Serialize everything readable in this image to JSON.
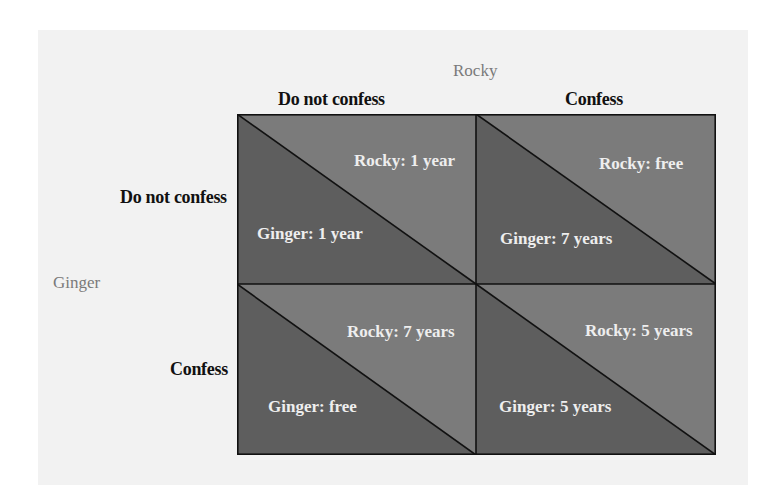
{
  "players": {
    "column": "Rocky",
    "row": "Ginger"
  },
  "column_strategies": [
    "Do not confess",
    "Confess"
  ],
  "row_strategies": [
    "Do not confess",
    "Confess"
  ],
  "colors": {
    "panel_background": "#f2f2f2",
    "upper_triangle": "#7b7b7b",
    "lower_triangle": "#5e5e5e",
    "grid_lines": "#111111",
    "cell_text": "#eeeeee",
    "player_label": "#7a7a7a"
  },
  "cells": [
    {
      "row": "Do not confess",
      "col": "Do not confess",
      "rocky": "Rocky: 1 year",
      "ginger": "Ginger: 1 year"
    },
    {
      "row": "Do not confess",
      "col": "Confess",
      "rocky": "Rocky: free",
      "ginger": "Ginger: 7 years"
    },
    {
      "row": "Confess",
      "col": "Do not confess",
      "rocky": "Rocky: 7 years",
      "ginger": "Ginger: free"
    },
    {
      "row": "Confess",
      "col": "Confess",
      "rocky": "Rocky: 5 years",
      "ginger": "Ginger: 5 years"
    }
  ]
}
